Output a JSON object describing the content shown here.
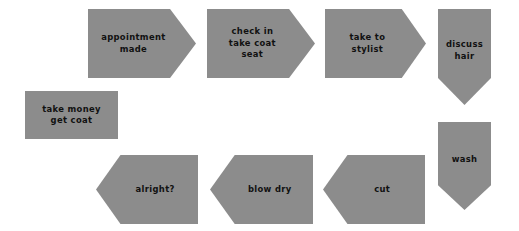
{
  "diagram": {
    "background_color": "#ffffff",
    "node_fill_color": "#8c8c8c",
    "node_text_color": "#111111",
    "shadow_color": "#bdbdbd",
    "nodes": [
      {
        "id": "appointment-made",
        "label": "appointment\nmade",
        "shape": "arrow-right",
        "x": 88,
        "y": 9,
        "w": 108,
        "h": 69
      },
      {
        "id": "check-in-take-coat-seat",
        "label": "check in\ntake coat\nseat",
        "shape": "arrow-right",
        "x": 207,
        "y": 9,
        "w": 108,
        "h": 69
      },
      {
        "id": "take-to-stylist",
        "label": "take to\nstylist",
        "shape": "arrow-right",
        "x": 325,
        "y": 9,
        "w": 101,
        "h": 69
      },
      {
        "id": "discuss-hair",
        "label": "discuss\nhair",
        "shape": "arrow-down",
        "x": 438,
        "y": 9,
        "w": 53,
        "h": 96
      },
      {
        "id": "wash",
        "label": "wash",
        "shape": "arrow-down",
        "x": 438,
        "y": 122,
        "w": 53,
        "h": 88
      },
      {
        "id": "cut",
        "label": "cut",
        "shape": "arrow-left",
        "x": 323,
        "y": 155,
        "w": 102,
        "h": 69
      },
      {
        "id": "blow-dry",
        "label": "blow dry",
        "shape": "arrow-left",
        "x": 210,
        "y": 155,
        "w": 103,
        "h": 69
      },
      {
        "id": "alright",
        "label": "alright?",
        "shape": "arrow-left",
        "x": 96,
        "y": 155,
        "w": 102,
        "h": 69
      },
      {
        "id": "take-money-get-coat",
        "label": "take money\nget coat",
        "shape": "rect",
        "x": 25,
        "y": 91,
        "w": 93,
        "h": 48
      }
    ]
  }
}
